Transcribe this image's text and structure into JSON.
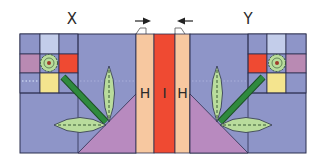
{
  "diagram": {
    "title_labels": {
      "left": "X",
      "right": "Y"
    },
    "strip_labels": {
      "left_strip": "H",
      "center_strip": "I",
      "right_strip": "H"
    },
    "arrows": {
      "left": "arrow-right",
      "right": "arrow-left"
    },
    "colors": {
      "background_blue": "#8e95c8",
      "light_blue": "#c3cdea",
      "mauve": "#b98ab3",
      "red": "#ef4a32",
      "yellow": "#f4e48e",
      "peach": "#f7c8a0",
      "leaf_green": "#b9dc9c",
      "stem_green": "#2f8a3e",
      "triangle_purple": "#b88abf",
      "outline": "#2b2f4f"
    }
  }
}
